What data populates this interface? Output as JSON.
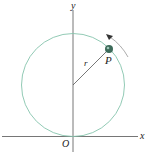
{
  "diagram": {
    "axes": {
      "x_label": "x",
      "y_label": "y",
      "origin_label": "O"
    },
    "circle": {
      "radius_label": "r",
      "color": "#7fbfa8"
    },
    "point": {
      "label": "P",
      "color": "#3d6b5a"
    },
    "motion": {
      "direction": "counterclockwise"
    },
    "colors": {
      "axis": "#555555",
      "text": "#222222"
    }
  }
}
